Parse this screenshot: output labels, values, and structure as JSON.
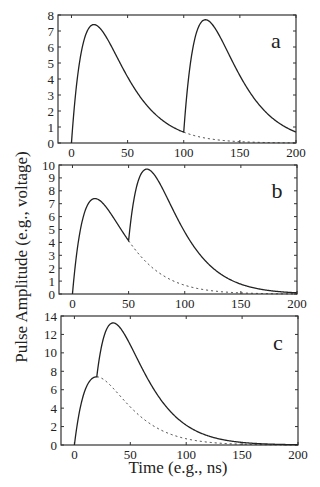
{
  "figure": {
    "ylabel": "Pulse Amplitude (e.g., voltage)",
    "xlabel": "Time (e.g., ns)"
  },
  "chart_data": [
    {
      "type": "line",
      "panel_label": "a",
      "title": "",
      "xlabel": "Time (e.g., ns)",
      "ylabel": "Pulse Amplitude (e.g., voltage)",
      "xlim": [
        -12,
        200
      ],
      "ylim": [
        0,
        8
      ],
      "xticks": [
        0,
        50,
        100,
        150,
        200
      ],
      "yticks": [
        0,
        1,
        2,
        3,
        4,
        5,
        6,
        7,
        8
      ],
      "grid": false,
      "pulse_model": "A*(t/20)*exp(1-t/20), A=7.4, peak at 20 ns",
      "pulse_onsets": [
        0,
        100
      ],
      "x": [
        0,
        10,
        20,
        30,
        40,
        50,
        60,
        70,
        80,
        90,
        100,
        110,
        120,
        130,
        140,
        150,
        160,
        170,
        180,
        190,
        200
      ],
      "series": [
        {
          "name": "summed response (solid)",
          "style": "solid",
          "values": [
            0,
            6.1,
            7.4,
            6.73,
            5.44,
            4.13,
            3.0,
            2.12,
            1.46,
            0.99,
            0.68,
            6.56,
            7.63,
            6.86,
            5.53,
            4.18,
            3.04,
            2.14,
            1.47,
            1.0,
            0.68
          ]
        },
        {
          "name": "first pulse alone (dotted)",
          "style": "dotted",
          "from_x": 100,
          "values": [
            0,
            6.1,
            7.4,
            6.73,
            5.44,
            4.13,
            3.0,
            2.12,
            1.46,
            0.99,
            0.68,
            0.45,
            0.3,
            0.19,
            0.12,
            0.08,
            0.05,
            0.03,
            0.02,
            0.01,
            0.01
          ]
        }
      ]
    },
    {
      "type": "line",
      "panel_label": "b",
      "title": "",
      "xlabel": "Time (e.g., ns)",
      "ylabel": "Pulse Amplitude (e.g., voltage)",
      "xlim": [
        -12,
        200
      ],
      "ylim": [
        0,
        10
      ],
      "xticks": [
        0,
        50,
        100,
        150,
        200
      ],
      "yticks": [
        0,
        1,
        2,
        3,
        4,
        5,
        6,
        7,
        8,
        9,
        10
      ],
      "grid": false,
      "pulse_onsets": [
        0,
        50
      ],
      "x": [
        0,
        10,
        20,
        30,
        40,
        50,
        60,
        70,
        80,
        90,
        100,
        110,
        120,
        130,
        140,
        150,
        160,
        170,
        180,
        190,
        200
      ],
      "series": [
        {
          "name": "summed response (solid)",
          "style": "solid",
          "values": [
            0,
            6.1,
            7.4,
            6.73,
            5.44,
            4.13,
            9.1,
            9.52,
            8.19,
            6.43,
            4.81,
            3.44,
            2.42,
            1.65,
            1.11,
            0.76,
            0.49,
            0.32,
            0.2,
            0.13,
            0.09
          ]
        },
        {
          "name": "first pulse alone (dotted)",
          "style": "dotted",
          "from_x": 50,
          "values": [
            0,
            6.1,
            7.4,
            6.73,
            5.44,
            4.13,
            3.0,
            2.12,
            1.46,
            0.99,
            0.68,
            0.45,
            0.3,
            0.19,
            0.12,
            0.08,
            0.05,
            0.03,
            0.02,
            0.01,
            0.01
          ]
        }
      ]
    },
    {
      "type": "line",
      "panel_label": "c",
      "title": "",
      "xlabel": "Time (e.g., ns)",
      "ylabel": "Pulse Amplitude (e.g., voltage)",
      "xlim": [
        -12,
        200
      ],
      "ylim": [
        0,
        14
      ],
      "xticks": [
        0,
        50,
        100,
        150,
        200
      ],
      "yticks": [
        0,
        2,
        4,
        6,
        8,
        10,
        12,
        14
      ],
      "grid": false,
      "pulse_onsets": [
        0,
        20
      ],
      "x": [
        0,
        10,
        20,
        30,
        40,
        50,
        60,
        70,
        80,
        90,
        100,
        110,
        120,
        130,
        140,
        150,
        160,
        170,
        180,
        190,
        200
      ],
      "series": [
        {
          "name": "summed response (solid)",
          "style": "solid",
          "values": [
            0,
            6.1,
            7.4,
            12.83,
            12.84,
            10.86,
            8.44,
            6.12,
            4.26,
            2.88,
            1.89,
            1.22,
            0.79,
            0.5,
            0.31,
            0.19,
            0.12,
            0.07,
            0.05,
            0.03,
            0.02
          ]
        },
        {
          "name": "first pulse alone (dotted)",
          "style": "dotted",
          "from_x": 20,
          "values": [
            0,
            6.1,
            7.4,
            6.73,
            5.44,
            4.13,
            3.0,
            2.12,
            1.46,
            0.99,
            0.68,
            0.45,
            0.3,
            0.19,
            0.12,
            0.08,
            0.05,
            0.03,
            0.02,
            0.01,
            0.01
          ]
        }
      ]
    }
  ]
}
